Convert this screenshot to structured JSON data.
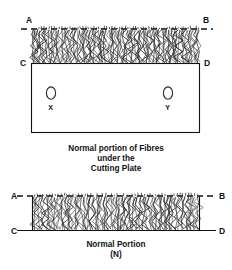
{
  "figure": {
    "title": "Normal portion of fibres under the cutting plate",
    "background_color": "#ffffff",
    "line_color": "#111111",
    "fibre_color": "#2a2a2a"
  },
  "upper_diagram": {
    "name": "fibres-under-cutting-plate",
    "corner_labels": {
      "top_left": "A",
      "top_right": "B",
      "bottom_left": "C",
      "bottom_right": "D"
    },
    "top_line_style": "dashed",
    "bottom_line_style": "solid",
    "fibre_band": {
      "description": "dense vertical zig-zag fibre tufts",
      "count": 64
    },
    "plate": {
      "name": "cutting-plate",
      "holes": [
        {
          "id": "hole-x",
          "label": "X"
        },
        {
          "id": "hole-y",
          "label": "Y"
        }
      ]
    },
    "caption_lines": [
      "Normal portion of Fibres",
      "under the",
      "Cutting Plate"
    ]
  },
  "lower_diagram": {
    "name": "normal-portion",
    "corner_labels": {
      "top_left": "A",
      "top_right": "B",
      "bottom_left": "C",
      "bottom_right": "D"
    },
    "top_line_style": "dashed",
    "bottom_line_style": "solid",
    "fibre_band": {
      "description": "dense vertical zig-zag fibre tufts",
      "count": 56
    },
    "caption_lines": [
      "Normal Portion",
      "(N)"
    ]
  }
}
